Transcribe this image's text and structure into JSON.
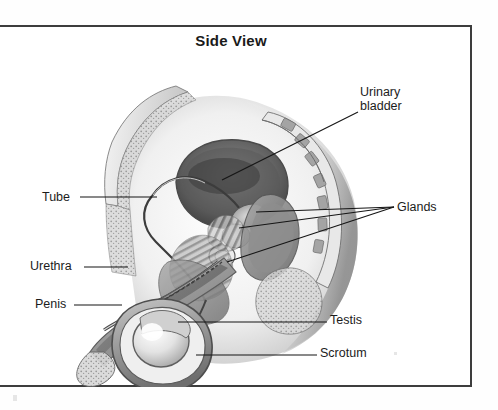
{
  "figure": {
    "title": "Side View",
    "view_type": "sagittal-section",
    "color_mode": "grayscale",
    "frame_color": "#3d3d3d",
    "background_color": "#ffffff",
    "text_color": "#1c1c1c"
  },
  "labels": {
    "urinary_bladder": {
      "line1": "Urinary",
      "line2": "bladder"
    },
    "glands": "Glands",
    "testis": "Testis",
    "scrotum": "Scrotum",
    "tube": "Tube",
    "urethra": "Urethra",
    "penis": "Penis"
  },
  "leader_lines": {
    "urinary_bladder": {
      "from_x": 358,
      "from_y": 112,
      "to_x": 222,
      "to_y": 180
    },
    "glands": [
      {
        "from_x": 394,
        "from_y": 207,
        "to_x": 256,
        "to_y": 212
      },
      {
        "from_x": 394,
        "from_y": 207,
        "to_x": 239,
        "to_y": 228
      },
      {
        "from_x": 394,
        "from_y": 207,
        "to_x": 227,
        "to_y": 262
      }
    ],
    "testis": {
      "from_x": 327,
      "from_y": 322,
      "to_x": 178,
      "to_y": 322
    },
    "scrotum": {
      "from_x": 317,
      "from_y": 355,
      "to_x": 196,
      "to_y": 355
    },
    "tube": {
      "from_x": 80,
      "from_y": 197,
      "to_x": 157,
      "to_y": 197
    },
    "urethra": {
      "from_x": 84,
      "from_y": 267,
      "to_x": 128,
      "to_y": 267
    },
    "penis": {
      "from_x": 74,
      "from_y": 305,
      "to_x": 122,
      "to_y": 305
    }
  },
  "anatomy_parts": [
    "abdominal-wall",
    "urinary-bladder",
    "vas-deferens-tube",
    "prostate-gland",
    "seminal-vesicle-gland",
    "bulbourethral-gland",
    "urethra",
    "penis-shaft",
    "glans-penis",
    "testis",
    "epididymis",
    "scrotum",
    "rectum",
    "sacrum-vertebrae",
    "buttock"
  ]
}
